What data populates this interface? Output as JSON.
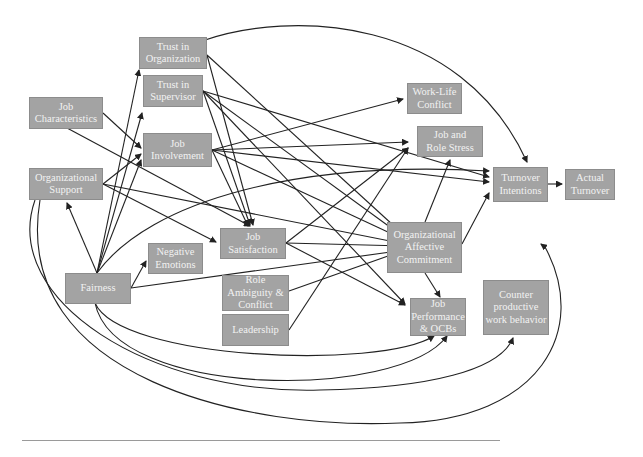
{
  "nodes": [
    {
      "id": "trust_org",
      "label": "Trust in\nOrganization",
      "x": 139,
      "y": 37,
      "w": 68,
      "h": 32
    },
    {
      "id": "trust_sup",
      "label": "Trust in\nSupervisor",
      "x": 143,
      "y": 75,
      "w": 60,
      "h": 32
    },
    {
      "id": "job_char",
      "label": "Job\nCharacteristics",
      "x": 29,
      "y": 97,
      "w": 74,
      "h": 32
    },
    {
      "id": "job_inv",
      "label": "Job\nInvolvement",
      "x": 143,
      "y": 133,
      "w": 69,
      "h": 34
    },
    {
      "id": "org_sup",
      "label": "Organizational\nSupport",
      "x": 29,
      "y": 168,
      "w": 74,
      "h": 32
    },
    {
      "id": "work_life",
      "label": "Work-Life\nConflict",
      "x": 407,
      "y": 83,
      "w": 55,
      "h": 31
    },
    {
      "id": "role_stress",
      "label": "Job and\nRole Stress",
      "x": 417,
      "y": 126,
      "w": 66,
      "h": 31
    },
    {
      "id": "turn_int",
      "label": "Turnover\nIntentions",
      "x": 493,
      "y": 167,
      "w": 55,
      "h": 35
    },
    {
      "id": "actual_turn",
      "label": "Actual\nTurnover",
      "x": 565,
      "y": 169,
      "w": 50,
      "h": 31
    },
    {
      "id": "job_sat",
      "label": "Job\nSatisfaction",
      "x": 220,
      "y": 228,
      "w": 66,
      "h": 31
    },
    {
      "id": "neg_emo",
      "label": "Negative\nEmotions",
      "x": 148,
      "y": 243,
      "w": 55,
      "h": 31
    },
    {
      "id": "oac",
      "label": "Organizational\nAffective\nCommitment",
      "x": 387,
      "y": 222,
      "w": 75,
      "h": 51
    },
    {
      "id": "fairness",
      "label": "Fairness",
      "x": 65,
      "y": 273,
      "w": 66,
      "h": 31
    },
    {
      "id": "role_amb",
      "label": "Role\nAmbiguity &\nConflict",
      "x": 222,
      "y": 275,
      "w": 67,
      "h": 36
    },
    {
      "id": "leadership",
      "label": "Leadership",
      "x": 222,
      "y": 314,
      "w": 67,
      "h": 32
    },
    {
      "id": "job_perf",
      "label": "Job\nPerformance\n& OCBs",
      "x": 410,
      "y": 298,
      "w": 56,
      "h": 38
    },
    {
      "id": "cwb",
      "label": "Counter\nproductive\nwork behavior",
      "x": 483,
      "y": 280,
      "w": 66,
      "h": 55
    }
  ],
  "edges": [
    {
      "d": "M 202 41 C 290 10, 460 15, 527 162"
    },
    {
      "d": "M 207 55 L 253 225"
    },
    {
      "d": "M 207 55 L 405 236"
    },
    {
      "d": "M 203 91 L 250 225"
    },
    {
      "d": "M 203 91 L 405 238"
    },
    {
      "d": "M 203 91 L 489 177"
    },
    {
      "d": "M 203 91 L 405 304"
    },
    {
      "d": "M 212 150 L 403 99"
    },
    {
      "d": "M 212 150 L 408 142"
    },
    {
      "d": "M 212 150 L 489 182"
    },
    {
      "d": "M 212 150 L 248 226"
    },
    {
      "d": "M 212 150 L 405 240"
    },
    {
      "d": "M 103 113 L 141 148"
    },
    {
      "d": "M 67 128 L 250 226"
    },
    {
      "d": "M 103 184 L 141 154"
    },
    {
      "d": "M 103 184 L 216 242"
    },
    {
      "d": "M 103 184 L 405 244"
    },
    {
      "d": "M 97 273 L 67 203"
    },
    {
      "d": "M 97 273 L 139 70"
    },
    {
      "d": "M 97 273 L 142 113"
    },
    {
      "d": "M 97 273 L 141 160"
    },
    {
      "d": "M 97 273 C 150 200, 300 160, 489 171"
    },
    {
      "d": "M 131 288 L 146 261"
    },
    {
      "d": "M 131 288 L 405 250"
    },
    {
      "d": "M 286 243 L 408 148"
    },
    {
      "d": "M 286 243 L 405 246"
    },
    {
      "d": "M 286 243 L 405 305"
    },
    {
      "d": "M 289 291 L 405 250"
    },
    {
      "d": "M 289 330 L 408 148"
    },
    {
      "d": "M 425 222 L 450 160"
    },
    {
      "d": "M 462 244 L 489 193"
    },
    {
      "d": "M 425 273 L 440 297"
    },
    {
      "d": "M 548 184 L 562 184"
    },
    {
      "d": "M 95 303 C 120 360, 380 370, 434 336"
    },
    {
      "d": "M 95 303 C 115 400, 400 400, 447 336"
    },
    {
      "d": "M 35 200 C 0 300, 150 395, 320 390 C 430 388, 500 370, 513 338"
    },
    {
      "d": "M 40 200 C 10 380, 250 430, 400 423 C 540 420, 590 330, 545 247 L 541 244"
    }
  ],
  "rule": {
    "x": 22,
    "y": 440,
    "w": 478
  }
}
